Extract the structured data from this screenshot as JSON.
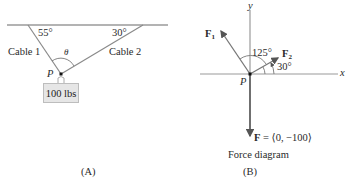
{
  "panel_a": {
    "label": "(A)",
    "cable1_label": "Cable 1",
    "cable2_label": "Cable 2",
    "angle1": "55°",
    "angle2": "30°",
    "theta": "θ",
    "point": "P",
    "weight": "100 lbs"
  },
  "panel_b": {
    "label": "(B)",
    "caption": "Force diagram",
    "x_axis": "x",
    "y_axis": "y",
    "point": "P",
    "f1": "F",
    "f1_sub": "1",
    "f2": "F",
    "f2_sub": "2",
    "angle_f1": "125°",
    "angle_f2": "30°",
    "f_label": "F",
    "f_value": " = ⟨0, −100⟩"
  },
  "colors": {
    "line": "#8a8a8a",
    "arrow": "#333333",
    "box_fill": "#e6e6e6"
  }
}
